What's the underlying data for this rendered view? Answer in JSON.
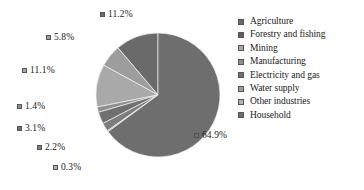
{
  "chart_data": {
    "type": "pie",
    "title": "",
    "subtitle": "",
    "xlabel": "",
    "ylabel": "",
    "grid": false,
    "legend_position": "right",
    "units": "percent",
    "categories": [
      "Agriculture",
      "Forestry and fishing",
      "Mining",
      "Manufacturing",
      "Electricity and gas",
      "Water supply",
      "Other industries",
      "Household"
    ],
    "values": [
      11.2,
      5.8,
      11.1,
      1.4,
      3.1,
      2.2,
      0.3,
      64.9
    ],
    "value_labels": [
      "11.2%",
      "5.8%",
      "11.1%",
      "1.4%",
      "3.1%",
      "2.2%",
      "0.3%",
      "64.9%"
    ],
    "colors": [
      "#6a6a6a",
      "#9d9d9d",
      "#a9a9a9",
      "#8f8f8f",
      "#707070",
      "#7d7d7d",
      "#b2b2b2",
      "#6e6e6e"
    ],
    "start_angle_deg": 0,
    "direction": "counterclockwise",
    "center": [
      158,
      95
    ],
    "radius": 62,
    "slices": [
      {
        "label": "Agriculture",
        "value": 11.2,
        "display": "11.2%",
        "color": "#6a6a6a",
        "callout": {
          "left": 100,
          "top": 10
        }
      },
      {
        "label": "Forestry and fishing",
        "value": 5.8,
        "display": "5.8%",
        "color": "#9d9d9d",
        "callout": {
          "left": 46,
          "top": 33
        }
      },
      {
        "label": "Mining",
        "value": 11.1,
        "display": "11.1%",
        "color": "#a9a9a9",
        "callout": {
          "left": 22,
          "top": 66
        }
      },
      {
        "label": "Manufacturing",
        "value": 1.4,
        "display": "1.4%",
        "color": "#8f8f8f",
        "callout": {
          "left": 17,
          "top": 102
        }
      },
      {
        "label": "Electricity and gas",
        "value": 3.1,
        "display": "3.1%",
        "color": "#707070",
        "callout": {
          "left": 17,
          "top": 124
        }
      },
      {
        "label": "Water supply",
        "value": 2.2,
        "display": "2.2%",
        "color": "#7d7d7d",
        "callout": {
          "left": 37,
          "top": 143
        }
      },
      {
        "label": "Other industries",
        "value": 0.3,
        "display": "0.3%",
        "color": "#b2b2b2",
        "callout": {
          "left": 53,
          "top": 163
        }
      },
      {
        "label": "Household",
        "value": 64.9,
        "display": "64.9%",
        "color": "#6e6e6e",
        "callout": {
          "left": 194,
          "top": 131
        }
      }
    ]
  },
  "legend": {
    "items": [
      {
        "label": "Agriculture",
        "color": "#6a6a6a"
      },
      {
        "label": "Forestry and fishing",
        "color": "#5e5e5e"
      },
      {
        "label": "Mining",
        "color": "#a9a9a9"
      },
      {
        "label": "Manufacturing",
        "color": "#8f8f8f"
      },
      {
        "label": "Electricity and gas",
        "color": "#707070"
      },
      {
        "label": "Water supply",
        "color": "#9d9d9d"
      },
      {
        "label": "Other industries",
        "color": "#b2b2b2"
      },
      {
        "label": "Household",
        "color": "#6e6e6e"
      }
    ]
  }
}
